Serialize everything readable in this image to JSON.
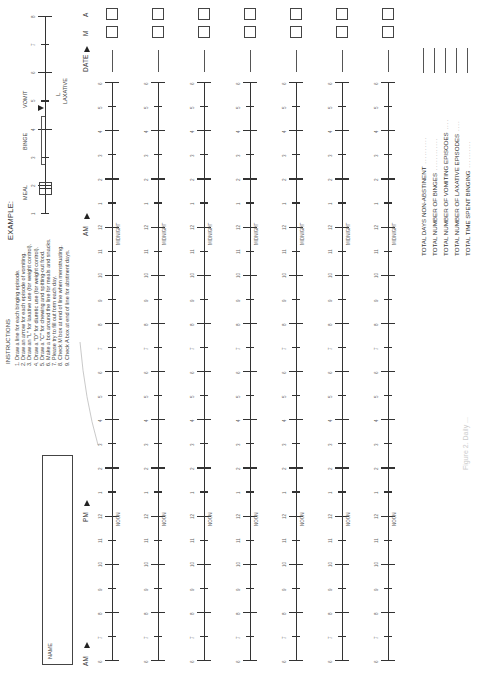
{
  "example": {
    "title": "EXAMPLE:",
    "labels": {
      "meal": "MEAL",
      "binge": "BINGE",
      "vomit": "VOMIT",
      "laxative": "LAXATIVE",
      "laxative_mark": "L"
    },
    "ticks": [
      "1",
      "2",
      "3",
      "4",
      "5",
      "6",
      "7",
      "8"
    ]
  },
  "instructions": {
    "title": "INSTRUCTIONS",
    "items": [
      "1. Draw a line for each binging episode.",
      "2. Draw an arrow for each episode of vomiting.",
      "3. Draw an \"L\" for laxative use (for weight control).",
      "4. Draw a \"D\" for diuretic use (for weight control).",
      "5. Draw a \"C\" for chewing and spitting-out food.",
      "6. Make a box around the line for meals and snacks.",
      "7. Please try to fill out form each day.",
      "8. Check M box at end of line when menstruating.",
      "9. Check A box at end of line for abstinent days."
    ]
  },
  "name_field": {
    "label": "NAME",
    "value": ""
  },
  "markers": {
    "am_start": "AM",
    "pm": "PM",
    "am_night": "AM",
    "date": "DATE",
    "m": "M",
    "a": "A",
    "noon": "NOON",
    "midnight": "MIDNIGHT"
  },
  "timeline": {
    "hours": [
      "6",
      "7",
      "8",
      "9",
      "10",
      "11",
      "12",
      "1",
      "2",
      "3",
      "4",
      "5",
      "6",
      "7",
      "8",
      "9",
      "10",
      "11",
      "12",
      "1",
      "2",
      "3",
      "4",
      "5",
      "6"
    ],
    "days": [
      {
        "date": "",
        "m_checked": false,
        "a_checked": false
      },
      {
        "date": "",
        "m_checked": false,
        "a_checked": false
      },
      {
        "date": "",
        "m_checked": false,
        "a_checked": false
      },
      {
        "date": "",
        "m_checked": false,
        "a_checked": false
      },
      {
        "date": "",
        "m_checked": false,
        "a_checked": false
      },
      {
        "date": "",
        "m_checked": false,
        "a_checked": false
      },
      {
        "date": "",
        "m_checked": false,
        "a_checked": false
      }
    ]
  },
  "totals": [
    {
      "label": "TOTAL DAYS NON-ABSTINENT",
      "value": ""
    },
    {
      "label": "TOTAL NUMBER OF BINGES",
      "value": ""
    },
    {
      "label": "TOTAL NUMBER OF VOMITING EPISODES",
      "value": ""
    },
    {
      "label": "TOTAL NUMBER OF LAXATIVE EPISODES",
      "value": ""
    },
    {
      "label": "TOTAL TIME SPENT BINGING",
      "value": ""
    }
  ],
  "caption": "Figure 2. Daily ..."
}
